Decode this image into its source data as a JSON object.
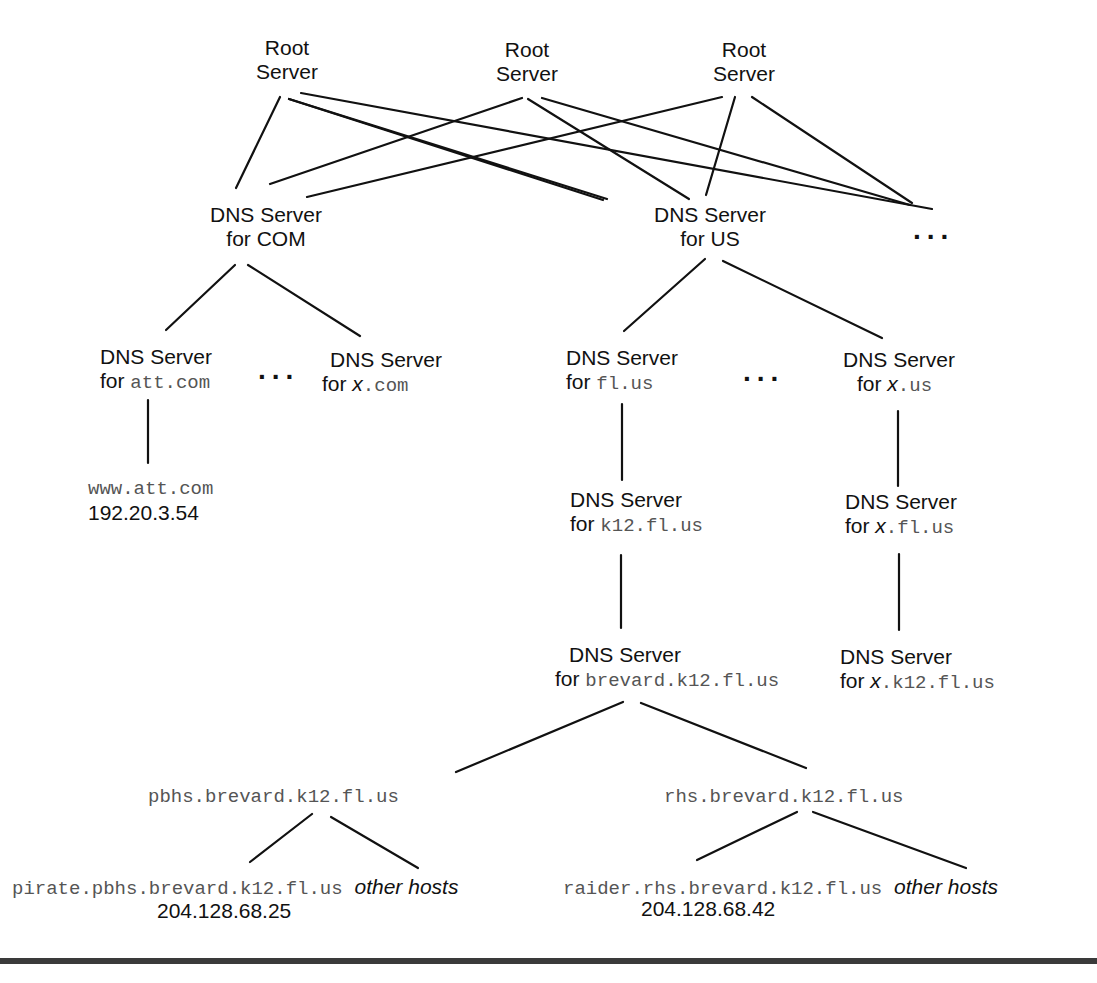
{
  "figure": {
    "root_servers": [
      {
        "line1": "Root",
        "line2": "Server"
      },
      {
        "line1": "Root",
        "line2": "Server"
      },
      {
        "line1": "Root",
        "line2": "Server"
      }
    ],
    "tld_servers": [
      {
        "line1": "DNS Server",
        "line2": "for COM"
      },
      {
        "line1": "DNS Server",
        "line2": "for US"
      }
    ],
    "ellipsis": "...",
    "com_children": [
      {
        "line1": "DNS Server",
        "prefix": "for ",
        "domain": "att.com"
      },
      {
        "line1": "DNS Server",
        "prefix": "for ",
        "var": "x",
        "domain": ".com"
      }
    ],
    "us_children": [
      {
        "line1": "DNS Server",
        "prefix": "for ",
        "domain": "fl.us"
      },
      {
        "line1": "DNS Server",
        "prefix": "for ",
        "var": "x",
        "domain": ".us"
      }
    ],
    "att_host": {
      "name": "www.att.com",
      "ip": "192.20.3.54"
    },
    "fl_children": [
      {
        "line1": "DNS Server",
        "prefix": "for ",
        "domain": "k12.fl.us"
      }
    ],
    "xus_children": [
      {
        "line1": "DNS Server",
        "prefix": "for ",
        "var": "x",
        "domain": ".fl.us"
      }
    ],
    "k12_children": [
      {
        "line1": "DNS Server",
        "prefix": "for ",
        "domain": "brevard.k12.fl.us"
      }
    ],
    "xfl_children": [
      {
        "line1": "DNS Server",
        "prefix": "for ",
        "var": "x",
        "domain": ".k12.fl.us"
      }
    ],
    "brevard_children": [
      {
        "name": "pbhs.brevard.k12.fl.us"
      },
      {
        "name": "rhs.brevard.k12.fl.us"
      }
    ],
    "hosts": [
      {
        "name": "pirate.pbhs.brevard.k12.fl.us",
        "ip": "204.128.68.25",
        "other": "other hosts"
      },
      {
        "name": "raider.rhs.brevard.k12.fl.us",
        "ip": "204.128.68.42",
        "other": "other hosts"
      }
    ]
  }
}
